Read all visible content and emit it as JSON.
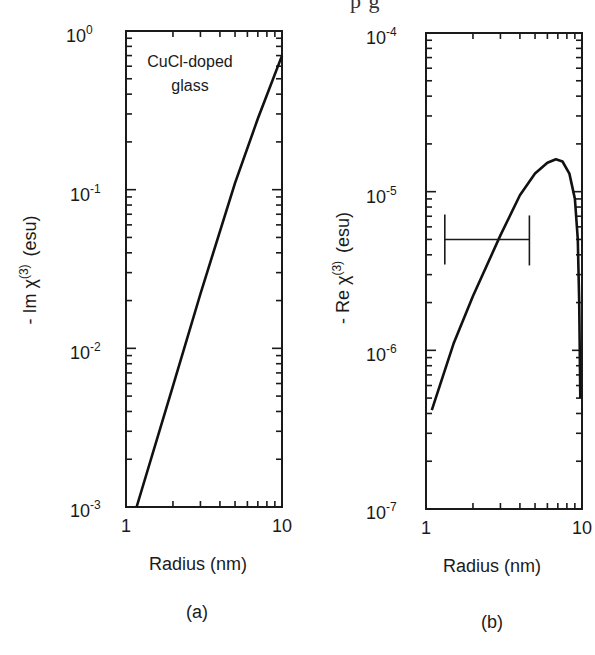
{
  "header_fragment": "p     g",
  "chart_data": [
    {
      "type": "line",
      "panel_label": "(a)",
      "title": "",
      "annotation": [
        "CuCl-doped",
        "glass"
      ],
      "xlabel": "Radius  (nm)",
      "ylabel": "- Im χ(3) (esu)",
      "xscale": "log",
      "yscale": "log",
      "xlim": [
        1,
        10
      ],
      "ylim": [
        0.001,
        1
      ],
      "x_ticks": [
        "1",
        "10"
      ],
      "y_ticks": [
        "10^0",
        "10^-1",
        "10^-2",
        "10^-3"
      ],
      "grid": false,
      "series": [
        {
          "name": "-Im χ(3)",
          "x": [
            1.17,
            2,
            3,
            5,
            7,
            10
          ],
          "values": [
            0.001,
            0.0058,
            0.022,
            0.11,
            0.28,
            0.7
          ]
        }
      ]
    },
    {
      "type": "line",
      "panel_label": "(b)",
      "title": "",
      "xlabel": "Radius (nm)",
      "ylabel": "- Re χ(3) (esu)",
      "xscale": "log",
      "yscale": "log",
      "xlim": [
        1,
        10
      ],
      "ylim": [
        1e-07,
        0.0001
      ],
      "x_ticks": [
        "1",
        "10"
      ],
      "y_ticks": [
        "10^-4",
        "10^-5",
        "10^-6",
        "10^-7"
      ],
      "grid": false,
      "series": [
        {
          "name": "-Re χ(3)",
          "x": [
            1.09,
            1.5,
            2,
            3,
            4,
            5,
            6,
            6.8,
            7.5,
            8.3,
            9,
            9.4,
            9.6,
            9.75
          ],
          "values": [
            4.2e-07,
            1.1e-06,
            2.2e-06,
            5.3e-06,
            9.5e-06,
            1.3e-05,
            1.52e-05,
            1.6e-05,
            1.55e-05,
            1.3e-05,
            9e-06,
            5e-06,
            2e-06,
            5e-07
          ]
        }
      ],
      "error_bar": {
        "y": 5e-06,
        "x_min": 1.32,
        "x_max": 4.6
      }
    }
  ],
  "panels": {
    "a": {
      "y_tick_labels": {
        "t0": "10",
        "e0": "0",
        "t1": "10",
        "e1": "-1",
        "t2": "10",
        "e2": "-2",
        "t3": "10",
        "e3": "-3"
      },
      "x_tick_labels": {
        "left": "1",
        "right": "10"
      },
      "annotation_line1": "CuCl-doped",
      "annotation_line2": "glass",
      "ylabel_prefix": "- Im χ",
      "ylabel_sup": "(3)",
      "ylabel_unit": "(esu)",
      "xlabel": "Radius  (nm)",
      "caption": "(a)"
    },
    "b": {
      "y_tick_labels": {
        "t0": "10",
        "e0": "-4",
        "t1": "10",
        "e1": "-5",
        "t2": "10",
        "e2": "-6",
        "t3": "10",
        "e3": "-7"
      },
      "x_tick_labels": {
        "left": "1",
        "right": "10"
      },
      "ylabel_prefix": "- Re χ",
      "ylabel_sup": "(3)",
      "ylabel_unit": "(esu)",
      "xlabel": "Radius (nm)",
      "caption": "(b)"
    }
  }
}
